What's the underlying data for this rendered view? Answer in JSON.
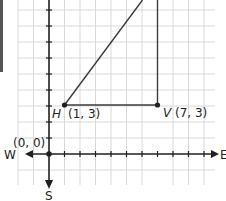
{
  "diagram": {
    "type": "coordinate-grid",
    "axes": {
      "x_positive_label": "E",
      "x_negative_label": "W",
      "y_negative_label": "S"
    },
    "origin_label": "(0, 0)",
    "points": [
      {
        "name": "H",
        "coords": "(1, 3)",
        "x": 1,
        "y": 3
      },
      {
        "name": "V",
        "coords": "(7, 3)",
        "x": 7,
        "y": 3
      }
    ],
    "segments": [
      {
        "from": "H",
        "to": "V",
        "kind": "horizontal"
      },
      {
        "from": "H",
        "to": "off-top",
        "kind": "diagonal"
      },
      {
        "from": "V",
        "to": "off-top",
        "kind": "vertical"
      }
    ],
    "colors": {
      "grid": "#d9d9d9",
      "axis": "#231f20",
      "line": "#3a3a3a"
    }
  }
}
